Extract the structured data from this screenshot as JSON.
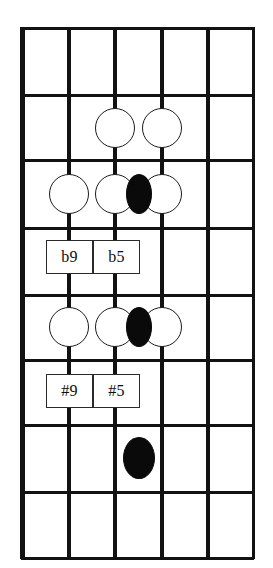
{
  "diagram": {
    "kind": "guitar-fretboard-diagram",
    "orientation": "vertical",
    "string_count": 6,
    "fret_count": 8,
    "colors": {
      "line": "#121212",
      "open_note_fill": "#ffffff",
      "open_note_stroke": "#1a1a1a",
      "filled_note": "#0a0a0a",
      "label_box_fill": "#ffffff",
      "label_box_stroke": "#2a2a2a",
      "background": "#ffffff"
    },
    "geometry": {
      "left": 22,
      "right": 253,
      "top": 28,
      "bottom": 558,
      "string_x": [
        22,
        69,
        115,
        162,
        208,
        253
      ],
      "fret_y": [
        28,
        95,
        160,
        228,
        295,
        360,
        425,
        492,
        558
      ],
      "nut_width": 5,
      "string_width": 4,
      "outer_string_width": 3,
      "fret_width": 3
    },
    "notes": [
      {
        "name": "note-f2-s3-open",
        "string": 3,
        "fret_space": 2,
        "cx": 115,
        "cy": 128,
        "rx": 20,
        "ry": 20,
        "style": "open"
      },
      {
        "name": "note-f2-s4-open",
        "string": 4,
        "fret_space": 2,
        "cx": 162,
        "cy": 128,
        "rx": 20,
        "ry": 20,
        "style": "open"
      },
      {
        "name": "note-f3-s2-open",
        "string": 2,
        "fret_space": 3,
        "cx": 69,
        "cy": 194,
        "rx": 20,
        "ry": 20,
        "style": "open"
      },
      {
        "name": "note-f3-s3-open",
        "string": 3,
        "fret_space": 3,
        "cx": 115,
        "cy": 194,
        "rx": 20,
        "ry": 20,
        "style": "open"
      },
      {
        "name": "note-f3-mid-filled",
        "string": 3.5,
        "fret_space": 3,
        "cx": 139,
        "cy": 194,
        "rx": 13,
        "ry": 20,
        "style": "filled"
      },
      {
        "name": "note-f3-s4-open",
        "string": 4,
        "fret_space": 3,
        "cx": 162,
        "cy": 194,
        "rx": 20,
        "ry": 20,
        "style": "open"
      },
      {
        "name": "note-f5-s2-open",
        "string": 2,
        "fret_space": 5,
        "cx": 69,
        "cy": 327,
        "rx": 20,
        "ry": 20,
        "style": "open"
      },
      {
        "name": "note-f5-s3-open",
        "string": 3,
        "fret_space": 5,
        "cx": 115,
        "cy": 327,
        "rx": 20,
        "ry": 20,
        "style": "open"
      },
      {
        "name": "note-f5-mid-filled",
        "string": 3.5,
        "fret_space": 5,
        "cx": 139,
        "cy": 327,
        "rx": 13,
        "ry": 20,
        "style": "filled"
      },
      {
        "name": "note-f5-s4-open",
        "string": 4,
        "fret_space": 5,
        "cx": 162,
        "cy": 327,
        "rx": 20,
        "ry": 20,
        "style": "open"
      },
      {
        "name": "note-f7-s3-filled",
        "string": 3,
        "fret_space": 7,
        "cx": 139,
        "cy": 458,
        "rx": 16,
        "ry": 21,
        "style": "filled"
      }
    ],
    "labels": [
      {
        "name": "interval-label-b9",
        "text": "b9",
        "x": 46,
        "y": 240,
        "w": 47,
        "h": 34
      },
      {
        "name": "interval-label-b5",
        "text": "b5",
        "x": 93,
        "y": 240,
        "w": 47,
        "h": 34
      },
      {
        "name": "interval-label-sharp9",
        "text": "#9",
        "x": 46,
        "y": 374,
        "w": 47,
        "h": 34
      },
      {
        "name": "interval-label-sharp5",
        "text": "#5",
        "x": 93,
        "y": 374,
        "w": 47,
        "h": 34
      }
    ]
  }
}
